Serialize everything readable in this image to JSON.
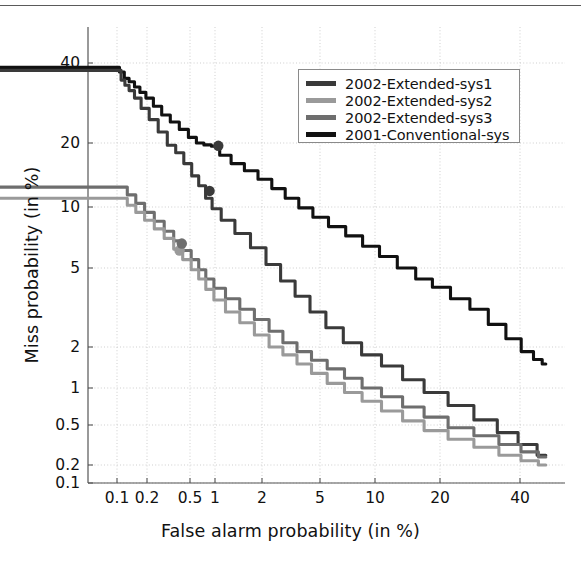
{
  "chart_data": {
    "type": "line",
    "title": "",
    "xlabel": "False alarm probability (in %)",
    "ylabel": "Miss probability (in %)",
    "scale": "normal-deviate (DET)",
    "grid": true,
    "legend_position": "upper-right",
    "xticks": [
      0.1,
      0.2,
      0.5,
      1,
      2,
      5,
      10,
      20,
      40
    ],
    "xtick_labels": [
      "0.1",
      "0.2",
      "0.5",
      "1",
      "2",
      "5",
      "10",
      "20",
      "40"
    ],
    "yticks": [
      40,
      20,
      10,
      5,
      2,
      1,
      0.5,
      0.2,
      0.1
    ],
    "ytick_labels": [
      "40",
      "20",
      "10",
      "5",
      "2",
      "1",
      "0.5",
      "0.2",
      "0.1"
    ],
    "xlim": [
      0.05,
      50
    ],
    "ylim": [
      0.08,
      48
    ],
    "series": [
      {
        "name": "2002-Extended-sys1",
        "color": "#3a3a3a",
        "points": [
          [
            0.055,
            47.0
          ],
          [
            0.062,
            45.5
          ],
          [
            0.07,
            44.5
          ],
          [
            0.075,
            44.0
          ],
          [
            0.082,
            41.5
          ],
          [
            0.09,
            41.0
          ],
          [
            0.098,
            38.0
          ],
          [
            0.105,
            37.5
          ],
          [
            0.115,
            34.5
          ],
          [
            0.125,
            33.0
          ],
          [
            0.14,
            31.5
          ],
          [
            0.16,
            29.5
          ],
          [
            0.19,
            27.0
          ],
          [
            0.23,
            24.5
          ],
          [
            0.28,
            22.0
          ],
          [
            0.34,
            19.5
          ],
          [
            0.4,
            18.0
          ],
          [
            0.48,
            16.0
          ],
          [
            0.58,
            14.0
          ],
          [
            0.7,
            12.6
          ],
          [
            0.85,
            11.0
          ],
          [
            1.0,
            9.8
          ],
          [
            1.2,
            8.6
          ],
          [
            1.5,
            7.4
          ],
          [
            1.9,
            6.3
          ],
          [
            2.4,
            5.2
          ],
          [
            3.0,
            4.3
          ],
          [
            3.8,
            3.6
          ],
          [
            4.8,
            3.0
          ],
          [
            6.0,
            2.5
          ],
          [
            7.5,
            2.1
          ],
          [
            9.5,
            1.75
          ],
          [
            12.0,
            1.45
          ],
          [
            15.0,
            1.15
          ],
          [
            19.0,
            0.92
          ],
          [
            24.0,
            0.72
          ],
          [
            30.0,
            0.55
          ],
          [
            36.0,
            0.42
          ],
          [
            43.0,
            0.32
          ],
          [
            50.0,
            0.25
          ]
        ],
        "markers": [
          [
            0.86,
            11.9
          ],
          [
            1.05,
            19.4
          ]
        ]
      },
      {
        "name": "2002-Extended-sys2",
        "color": "#9a9a9a",
        "points": [
          [
            0.055,
            13.2
          ],
          [
            0.065,
            12.8
          ],
          [
            0.08,
            12.2
          ],
          [
            0.095,
            11.6
          ],
          [
            0.115,
            11.0
          ],
          [
            0.14,
            10.2
          ],
          [
            0.17,
            9.4
          ],
          [
            0.21,
            8.6
          ],
          [
            0.26,
            7.8
          ],
          [
            0.32,
            7.0
          ],
          [
            0.39,
            6.2
          ],
          [
            0.47,
            5.5
          ],
          [
            0.58,
            4.9
          ],
          [
            0.7,
            4.4
          ],
          [
            0.86,
            3.9
          ],
          [
            1.05,
            3.45
          ],
          [
            1.3,
            3.0
          ],
          [
            1.6,
            2.65
          ],
          [
            2.0,
            2.3
          ],
          [
            2.5,
            2.0
          ],
          [
            3.1,
            1.75
          ],
          [
            3.9,
            1.5
          ],
          [
            4.9,
            1.28
          ],
          [
            6.1,
            1.08
          ],
          [
            7.6,
            0.92
          ],
          [
            9.5,
            0.78
          ],
          [
            12.0,
            0.65
          ],
          [
            15.0,
            0.54
          ],
          [
            19.0,
            0.44
          ],
          [
            24.0,
            0.36
          ],
          [
            30.0,
            0.3
          ],
          [
            37.0,
            0.25
          ],
          [
            44.0,
            0.22
          ],
          [
            50.0,
            0.2
          ]
        ],
        "markers": [
          [
            0.4,
            6.1
          ]
        ]
      },
      {
        "name": "2002-Extended-sys3",
        "color": "#6e6e6e",
        "points": [
          [
            0.055,
            16.2
          ],
          [
            0.065,
            15.4
          ],
          [
            0.08,
            14.4
          ],
          [
            0.095,
            13.4
          ],
          [
            0.115,
            12.4
          ],
          [
            0.14,
            11.4
          ],
          [
            0.17,
            10.4
          ],
          [
            0.21,
            9.4
          ],
          [
            0.26,
            8.5
          ],
          [
            0.32,
            7.6
          ],
          [
            0.39,
            6.8
          ],
          [
            0.47,
            6.1
          ],
          [
            0.58,
            5.5
          ],
          [
            0.7,
            4.9
          ],
          [
            0.86,
            4.4
          ],
          [
            1.05,
            3.95
          ],
          [
            1.3,
            3.5
          ],
          [
            1.6,
            3.1
          ],
          [
            2.0,
            2.75
          ],
          [
            2.5,
            2.4
          ],
          [
            3.1,
            2.1
          ],
          [
            3.9,
            1.85
          ],
          [
            4.9,
            1.6
          ],
          [
            6.1,
            1.38
          ],
          [
            7.6,
            1.18
          ],
          [
            9.5,
            1.0
          ],
          [
            12.0,
            0.85
          ],
          [
            15.0,
            0.7
          ],
          [
            19.0,
            0.58
          ],
          [
            24.0,
            0.47
          ],
          [
            30.0,
            0.39
          ],
          [
            37.0,
            0.32
          ],
          [
            44.0,
            0.27
          ],
          [
            50.0,
            0.24
          ]
        ],
        "markers": [
          [
            0.42,
            6.6
          ]
        ]
      },
      {
        "name": "2001-Conventional-sys",
        "color": "#111111",
        "points": [
          [
            0.055,
            47.0
          ],
          [
            0.062,
            45.0
          ],
          [
            0.07,
            44.0
          ],
          [
            0.08,
            41.5
          ],
          [
            0.09,
            40.5
          ],
          [
            0.1,
            38.5
          ],
          [
            0.112,
            37.0
          ],
          [
            0.125,
            35.0
          ],
          [
            0.14,
            34.0
          ],
          [
            0.16,
            32.5
          ],
          [
            0.18,
            31.0
          ],
          [
            0.21,
            29.5
          ],
          [
            0.25,
            27.5
          ],
          [
            0.3,
            25.5
          ],
          [
            0.36,
            24.0
          ],
          [
            0.44,
            22.5
          ],
          [
            0.54,
            21.0
          ],
          [
            0.66,
            20.0
          ],
          [
            0.82,
            19.6
          ],
          [
            1.0,
            19.3
          ],
          [
            1.15,
            17.5
          ],
          [
            1.4,
            16.0
          ],
          [
            1.7,
            14.8
          ],
          [
            2.1,
            13.5
          ],
          [
            2.6,
            12.2
          ],
          [
            3.2,
            11.0
          ],
          [
            4.0,
            9.9
          ],
          [
            5.0,
            8.9
          ],
          [
            6.2,
            8.0
          ],
          [
            7.7,
            7.2
          ],
          [
            9.5,
            6.4
          ],
          [
            11.5,
            5.7
          ],
          [
            14.0,
            5.0
          ],
          [
            17.0,
            4.4
          ],
          [
            20.0,
            4.0
          ],
          [
            24.0,
            3.5
          ],
          [
            28.0,
            3.1
          ],
          [
            33.0,
            2.6
          ],
          [
            38.0,
            2.2
          ],
          [
            43.0,
            1.85
          ],
          [
            47.0,
            1.62
          ],
          [
            50.0,
            1.5
          ]
        ],
        "markers": []
      }
    ]
  },
  "legend": {
    "items": [
      {
        "label": "2002-Extended-sys1",
        "color": "#3a3a3a"
      },
      {
        "label": "2002-Extended-sys2",
        "color": "#9a9a9a"
      },
      {
        "label": "2002-Extended-sys3",
        "color": "#6e6e6e"
      },
      {
        "label": "2001-Conventional-sys",
        "color": "#111111"
      }
    ]
  },
  "axes": {
    "xlabel": "False alarm probability (in %)",
    "ylabel": "Miss probability (in %)"
  }
}
